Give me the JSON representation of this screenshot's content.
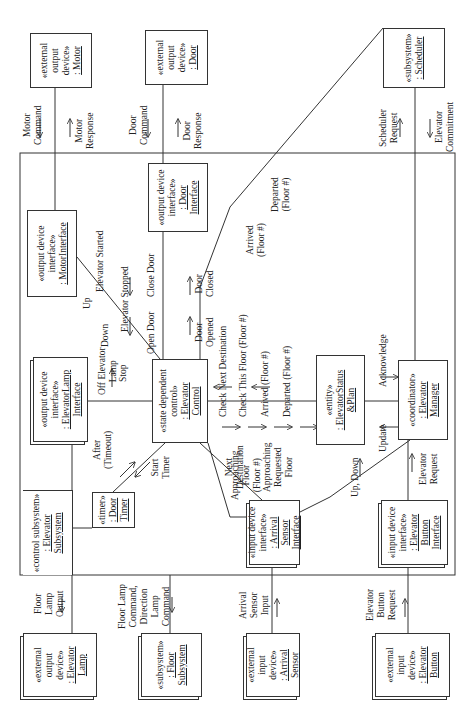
{
  "diagram": {
    "type": "UML communication diagram",
    "orientation": "rotated -90deg (text reads bottom-to-top)",
    "boundary": {
      "stereotype": "«control subsystem»",
      "name": ": Elevator",
      "name2": "Subsystem"
    },
    "objects": {
      "motor": {
        "stereotype": "«external",
        "stereotype2": "output",
        "stereotype3": "device»",
        "name": ": Motor"
      },
      "door": {
        "stereotype": "«external",
        "stereotype2": "output",
        "stereotype3": "device»",
        "name": ": Door"
      },
      "scheduler": {
        "stereotype": "«subsystem»",
        "name": ": Scheduler"
      },
      "motor_interface": {
        "stereotype": "«output device",
        "stereotype2": "interface»",
        "name": ": MotorInterface"
      },
      "door_interface": {
        "stereotype": "«output device",
        "stereotype2": "interface»",
        "name": ": Door",
        "name2": "Interface"
      },
      "elevator_lamp_interface": {
        "stereotype": "«output device",
        "stereotype2": "interface»",
        "name": ": ElevatorLamp",
        "name2": "Interface"
      },
      "elevator_control": {
        "stereotype": "«state dependent",
        "stereotype2": "control»",
        "name": ": Elevator",
        "name2": "Control"
      },
      "door_timer": {
        "stereotype": "«timer»",
        "name": ": Door",
        "name2": "Timer"
      },
      "elevator_status_plan": {
        "stereotype": "«entity»",
        "name": ": ElevatorStatus",
        "name2": "&Plan"
      },
      "elevator_manager": {
        "stereotype": "«coordinator»",
        "name": ": Elevator",
        "name2": "Manager"
      },
      "arrival_sensor_interface": {
        "stereotype": "«input device",
        "stereotype2": "interface»",
        "name": ": Arrival",
        "name2": "Sensor",
        "name3": "Interface"
      },
      "elevator_button_interface": {
        "stereotype": "«input device",
        "stereotype2": "interface»",
        "name": ": Elevator",
        "name2": "Button",
        "name3": "Interface"
      },
      "elevator_lamp": {
        "stereotype": "«external",
        "stereotype2": "output",
        "stereotype3": "device»",
        "name": ": Elevator",
        "name2": "Lamp"
      },
      "floor_subsystem": {
        "stereotype": "«subsystem»",
        "name": ": Floor",
        "name2": "Subsystem"
      },
      "arrival_sensor": {
        "stereotype": "«external",
        "stereotype2": "input",
        "stereotype3": "device»",
        "name": ": Arrival",
        "name2": "Sensor"
      },
      "elevator_button": {
        "stereotype": "«external",
        "stereotype2": "input",
        "stereotype3": "device»",
        "name": ": Elevator",
        "name2": "Button"
      }
    },
    "messages": {
      "motor_command": "Motor Command →",
      "motor_response": "← Motor Response",
      "door_command": "Door Command →",
      "door_response": "← Door Response",
      "scheduler_request": "Scheduler Request ←",
      "elevator_commitment": "→ Elevator Commitment",
      "up": "Up",
      "down": "Down",
      "stop": "Stop",
      "elevator_started": "Elevator Started",
      "elevator_stopped": "Elevator Stopped",
      "open_door": "Open Door",
      "close_door": "Close Door",
      "door_opened": "Door Opened",
      "door_closed": "Door Closed",
      "arrived_floor": "Arrived (Floor #)",
      "departed_floor": "Departed (Floor #)",
      "off_elevator_lamp": "Off Elevator Lamp",
      "after_timeout": "After (Timeout)",
      "start_timer": "Start Timer",
      "check_next_destination": "Check Next Destination",
      "check_this_floor": "Check This Floor (Floor #)",
      "arrived_floor_status": "Arrived (Floor #)",
      "departed_floor_status": "Departed (Floor #)",
      "next_destination": "Next Destination",
      "approaching_requested_floor": "Approaching Requested Floor",
      "acknowledge": "Acknowledge",
      "update": "Update",
      "elevator_request": "Elevator Request",
      "approaching_floor": "Approaching Floor (Floor #)",
      "up_down": "Up, Down",
      "floor_lamp_output": "Floor Lamp Output",
      "floor_lamp_command": "Floor Lamp Command, Direction Lamp Command",
      "arrival_sensor_input": "Arrival Sensor Input",
      "elevator_button_request": "Elevator Button Request"
    },
    "labels": {
      "motor_command": "Motor",
      "motor_command2": "Command",
      "motor_response": "Motor",
      "motor_response2": "Response",
      "door_command": "Door",
      "door_command2": "Command",
      "door_response": "Door",
      "door_response2": "Response",
      "scheduler_request": "Scheduler",
      "scheduler_request2": "Request",
      "elevator_commitment": "Elevator",
      "elevator_commitment2": "Commitment",
      "up": "Up",
      "down": "Down",
      "stop": "Stop",
      "elevator_started": "Elevator Started",
      "elevator_stopped": "Elevator Stopped",
      "open_door": "Open Door",
      "close_door": "Close Door",
      "door_opened": "Door",
      "door_opened2": "Opened",
      "door_closed": "Door",
      "door_closed2": "Closed",
      "arrived": "Arrived",
      "arrived2": "(Floor #)",
      "departed": "Departed",
      "departed2": "(Floor #)",
      "off_elevator": "Off Elevator",
      "lamp": "Lamp",
      "after": "After",
      "timeout": "(Timeout)",
      "start": "Start",
      "timer": "Timer",
      "check_next_destination": "Check Next Destination",
      "check_this_floor": "Check This Floor (Floor #)",
      "arrived_status": "Arrived (Floor #)",
      "departed_status": "Departed (Floor #)",
      "next": "Next",
      "destination": "Destination",
      "approaching": "Approaching",
      "requested": "Requested",
      "floor": "Floor",
      "acknowledge": "Acknowledge",
      "update": "Update",
      "elevator_request": "Elevator",
      "elevator_request2": "Request",
      "approaching_floor": "Approaching",
      "approaching_floor2": "Floor",
      "approaching_floor3": "(Floor #)",
      "up_down": "Up, Down",
      "floor_lamp_output": "Floor",
      "floor_lamp_output2": "Lamp",
      "floor_lamp_output3": "Output",
      "floor_lamp_command": "Floor Lamp",
      "floor_lamp_command2": "Command,",
      "floor_lamp_command3": "Direction",
      "floor_lamp_command4": "Lamp",
      "floor_lamp_command5": "Command",
      "arrival_sensor_input": "Arrival",
      "arrival_sensor_input2": "Sensor",
      "arrival_sensor_input3": "Input",
      "elevator_button_request": "Elevator",
      "elevator_button_request2": "Button",
      "elevator_button_request3": "Request"
    }
  }
}
